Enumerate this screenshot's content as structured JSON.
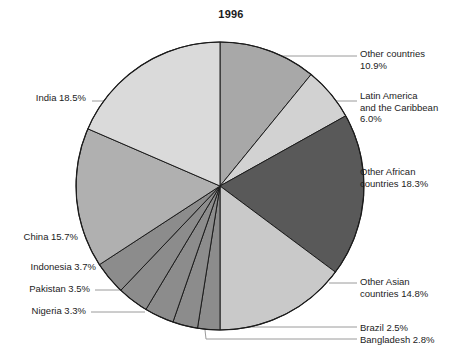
{
  "title": "1996",
  "chart_data": {
    "type": "pie",
    "title": "1996",
    "xlabel": "",
    "ylabel": "",
    "units": "percent",
    "start_angle_deg": 0,
    "direction": "clockwise",
    "total": 100.0,
    "legend_position": "callout-labels",
    "grid": false,
    "categories": [
      "Other countries",
      "Latin America and the Caribbean",
      "Other African countries",
      "Other Asian countries",
      "Brazil",
      "Bangladesh",
      "Nigeria",
      "Pakistan",
      "Indonesia",
      "China",
      "India"
    ],
    "values": [
      10.9,
      6.0,
      18.3,
      14.8,
      2.5,
      2.8,
      3.3,
      3.5,
      3.7,
      15.7,
      18.5
    ],
    "colors": [
      "#a8a8a8",
      "#d2d2d2",
      "#595959",
      "#c9c9c9",
      "#8c8c8c",
      "#8c8c8c",
      "#8c8c8c",
      "#8c8c8c",
      "#8c8c8c",
      "#b0b0b0",
      "#dadada"
    ],
    "slices": [
      {
        "label": "Other countries",
        "value": 10.9,
        "value_text": "10.9%",
        "color": "#a8a8a8"
      },
      {
        "label": "Latin America and the Caribbean",
        "value": 6.0,
        "value_text": "6.0%",
        "color": "#d2d2d2"
      },
      {
        "label": "Other African countries",
        "value": 18.3,
        "value_text": "18.3%",
        "color": "#595959"
      },
      {
        "label": "Other Asian countries",
        "value": 14.8,
        "value_text": "14.8%",
        "color": "#c9c9c9"
      },
      {
        "label": "Brazil",
        "value": 2.5,
        "value_text": "2.5%",
        "color": "#8c8c8c"
      },
      {
        "label": "Bangladesh",
        "value": 2.8,
        "value_text": "2.8%",
        "color": "#8c8c8c"
      },
      {
        "label": "Nigeria",
        "value": 3.3,
        "value_text": "3.3%",
        "color": "#8c8c8c"
      },
      {
        "label": "Pakistan",
        "value": 3.5,
        "value_text": "3.5%",
        "color": "#8c8c8c"
      },
      {
        "label": "Indonesia",
        "value": 3.7,
        "value_text": "3.7%",
        "color": "#8c8c8c"
      },
      {
        "label": "China",
        "value": 15.7,
        "value_text": "15.7%",
        "color": "#b0b0b0"
      },
      {
        "label": "India",
        "value": 18.5,
        "value_text": "18.5%",
        "color": "#dadada"
      }
    ]
  },
  "callouts": {
    "other_countries": "Other countries\n10.9%",
    "latin_america": "Latin America\nand the Caribbean\n6.0%",
    "other_african": "Other African\ncountries 18.3%",
    "other_asian": "Other Asian\ncountries 14.8%",
    "brazil": "Brazil 2.5%",
    "bangladesh": "Bangladesh 2.8%",
    "nigeria": "Nigeria 3.3%",
    "pakistan": "Pakistan 3.5%",
    "indonesia": "Indonesia 3.7%",
    "china": "China 15.7%",
    "india": "India 18.5%"
  }
}
